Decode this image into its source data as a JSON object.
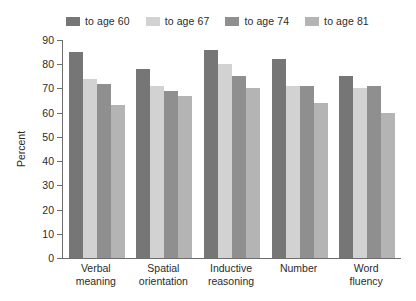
{
  "chart_data": {
    "type": "bar",
    "title": "",
    "subtitle": "",
    "xlabel": "",
    "ylabel": "Percent",
    "ylim": [
      0,
      90
    ],
    "grid": false,
    "legend_position": "top",
    "yticks": [
      0,
      10,
      20,
      30,
      40,
      50,
      60,
      70,
      80,
      90
    ],
    "ytick_labels": [
      "0",
      "10",
      "20",
      "30",
      "40",
      "50",
      "60",
      "70",
      "80",
      "90"
    ],
    "categories": [
      "Verbal\nmeaning",
      "Spatial\norientation",
      "Inductive\nreasoning",
      "Number",
      "Word\nfluency"
    ],
    "category_lines": [
      [
        "Verbal",
        "meaning"
      ],
      [
        "Spatial",
        "orientation"
      ],
      [
        "Inductive",
        "reasoning"
      ],
      [
        "Number",
        ""
      ],
      [
        "Word",
        "fluency"
      ]
    ],
    "series": [
      {
        "name": "to age 60",
        "color": "#767676",
        "values": [
          85,
          78,
          86,
          82,
          75
        ]
      },
      {
        "name": "to age 67",
        "color": "#d2d2d2",
        "values": [
          74,
          71,
          80,
          71,
          70
        ]
      },
      {
        "name": "to age 74",
        "color": "#8f8f8f",
        "values": [
          72,
          69,
          75,
          71,
          71
        ]
      },
      {
        "name": "to age 81",
        "color": "#b4b4b4",
        "values": [
          63,
          67,
          70,
          64,
          60
        ]
      }
    ]
  },
  "legend": {
    "items": [
      {
        "label": "to age 60",
        "color": "#767676"
      },
      {
        "label": "to age 67",
        "color": "#d2d2d2"
      },
      {
        "label": "to age 74",
        "color": "#8f8f8f"
      },
      {
        "label": "to age 81",
        "color": "#b4b4b4"
      }
    ]
  },
  "axes": {
    "y_title": "Percent",
    "axis_color": "#6d6d6d"
  }
}
